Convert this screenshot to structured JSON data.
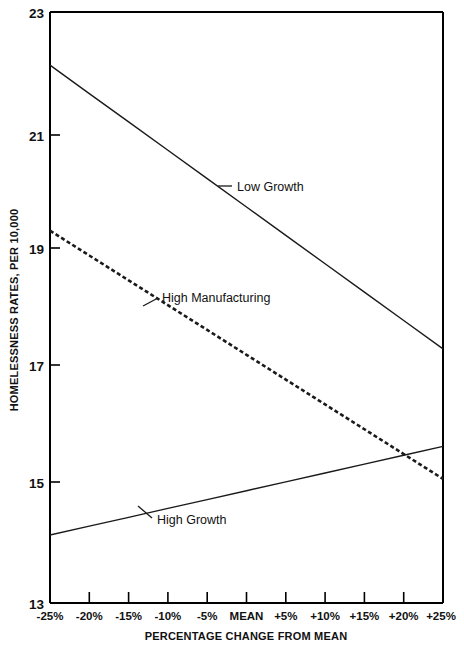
{
  "chart_data": {
    "type": "line",
    "title": "",
    "xlabel": "PERCENTAGE CHANGE FROM MEAN",
    "ylabel": "HOMELESSNESS RATES, PER 10,000",
    "grid": false,
    "legend_position": "inline-annotations",
    "xlim": [
      -25,
      25
    ],
    "ylim": [
      13,
      23
    ],
    "x": [
      -25,
      -20,
      -15,
      -10,
      -5,
      0,
      5,
      10,
      15,
      20,
      25
    ],
    "categories": [
      "-25%",
      "-20%",
      "-15%",
      "-10%",
      "-5%",
      "MEAN",
      "+5%",
      "+10%",
      "+15%",
      "+20%",
      "+25%"
    ],
    "ytick_labels": [
      "23",
      "21",
      "19",
      "17",
      "15",
      "13"
    ],
    "ytick_values": [
      23,
      21,
      19,
      17,
      15,
      13
    ],
    "series": [
      {
        "name": "Low Growth",
        "style": "solid",
        "values": [
          22.1,
          21.62,
          21.14,
          20.66,
          20.18,
          19.7,
          19.22,
          18.74,
          18.26,
          17.78,
          17.3
        ]
      },
      {
        "name": "High Manufacturing",
        "style": "dashed",
        "values": [
          19.3,
          18.88,
          18.46,
          18.04,
          17.62,
          17.2,
          16.78,
          16.36,
          15.94,
          15.52,
          15.1
        ]
      },
      {
        "name": "High Growth",
        "style": "thin",
        "values": [
          14.15,
          14.3,
          14.45,
          14.6,
          14.75,
          14.9,
          15.05,
          15.2,
          15.35,
          15.5,
          15.65
        ]
      }
    ],
    "annotations": [
      {
        "text": "Low Growth",
        "series": "Low Growth"
      },
      {
        "text": "High Manufacturing",
        "series": "High Manufacturing"
      },
      {
        "text": "High Growth",
        "series": "High Growth"
      }
    ]
  },
  "axes": {
    "y_tick_0": "23",
    "y_tick_1": "21",
    "y_tick_2": "19",
    "y_tick_3": "17",
    "y_tick_4": "15",
    "y_tick_5": "13",
    "x_tick_0": "-25%",
    "x_tick_1": "-20%",
    "x_tick_2": "-15%",
    "x_tick_3": "-10%",
    "x_tick_4": "-5%",
    "x_tick_5": "MEAN",
    "x_tick_6": "+5%",
    "x_tick_7": "+10%",
    "x_tick_8": "+15%",
    "x_tick_9": "+20%",
    "x_tick_10": "+25%",
    "x_axis_title": "PERCENTAGE CHANGE FROM MEAN",
    "y_axis_title": "HOMELESSNESS RATES, PER 10,000"
  },
  "labels": {
    "low_growth": "Low Growth",
    "high_manufacturing": "High Manufacturing",
    "high_growth": "High Growth"
  },
  "colors": {
    "line": "#1a1a1a",
    "axis": "#000000",
    "background": "#ffffff"
  }
}
